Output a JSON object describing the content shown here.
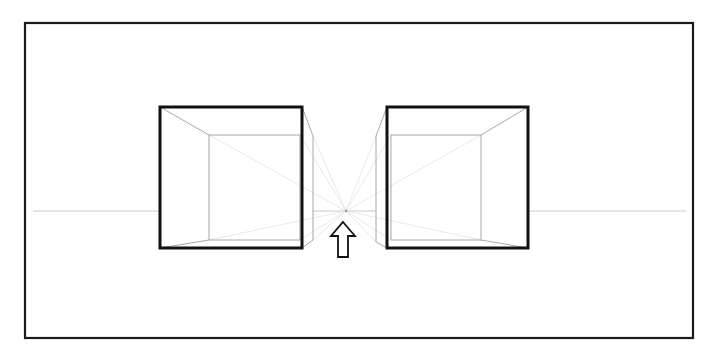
{
  "diagram": {
    "title": "",
    "colors": {
      "frame": "#1a1a1a",
      "box_outline": "#111111",
      "construction": "#a8a8a8",
      "horizon": "#c8c8c8",
      "background": "#ffffff"
    },
    "frame": {
      "x": 25,
      "y": 23,
      "w": 668,
      "h": 315
    },
    "horizon_y": 211,
    "vanishing_point": {
      "x": 346,
      "y": 211
    },
    "boxes": [
      {
        "name": "left-cube",
        "front": {
          "x": 160,
          "y": 107,
          "w": 142,
          "h": 141
        },
        "back": {
          "x": 209,
          "y": 135,
          "w": 91,
          "h": 105
        },
        "side_x": 313
      },
      {
        "name": "right-cube",
        "front": {
          "x": 387,
          "y": 107,
          "w": 141,
          "h": 141
        },
        "back": {
          "x": 391,
          "y": 135,
          "w": 90,
          "h": 105
        },
        "side_x": 376
      }
    ],
    "arrow": {
      "direction": "up",
      "x": 343,
      "tip_y": 222,
      "bottom_y": 257
    }
  }
}
